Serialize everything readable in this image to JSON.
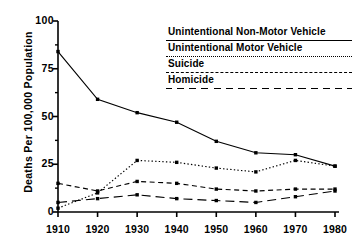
{
  "chart_data": {
    "type": "line",
    "title": "",
    "xlabel": "",
    "ylabel": "Deaths Per 100,000 Population",
    "x": [
      1910,
      1920,
      1930,
      1940,
      1950,
      1960,
      1970,
      1980
    ],
    "xtick_labels": [
      "1910",
      "1920",
      "1930",
      "1940",
      "1950",
      "1960",
      "1970",
      "1980"
    ],
    "ytick_labels": [
      "0",
      "25",
      "50",
      "75",
      "100"
    ],
    "ytick_values": [
      0,
      25,
      50,
      75,
      100
    ],
    "ylim": [
      0,
      100
    ],
    "xlim": [
      1910,
      1980
    ],
    "grid": false,
    "legend_position": "upper-right",
    "minor_ticks": true,
    "series": [
      {
        "name": "Unintentional Non-Motor Vehicle",
        "style": "solid",
        "values": [
          84,
          59,
          52,
          47,
          37,
          31,
          30,
          24
        ]
      },
      {
        "name": "Unintentional Motor Vehicle",
        "style": "dotted",
        "values": [
          2,
          10,
          27,
          26,
          23,
          21,
          27,
          24
        ]
      },
      {
        "name": "Suicide",
        "style": "dashed",
        "values": [
          15,
          11,
          16,
          15,
          12,
          11,
          12,
          12
        ]
      },
      {
        "name": "Homicide",
        "style": "long-dash",
        "values": [
          5,
          7,
          9,
          7,
          6,
          5,
          8,
          11
        ]
      }
    ]
  },
  "axes": {
    "y_title": "Deaths Per 100,000 Population"
  },
  "legend": {
    "entries": [
      {
        "label": "Unintentional Non-Motor Vehicle",
        "style": "solid"
      },
      {
        "label": "Unintentional Motor Vehicle",
        "style": "dotted"
      },
      {
        "label": "Suicide",
        "style": "dashed"
      },
      {
        "label": "Homicide",
        "style": "long-dash"
      }
    ]
  },
  "colors": {
    "line": "#000000",
    "background": "#ffffff",
    "text": "#000000"
  }
}
